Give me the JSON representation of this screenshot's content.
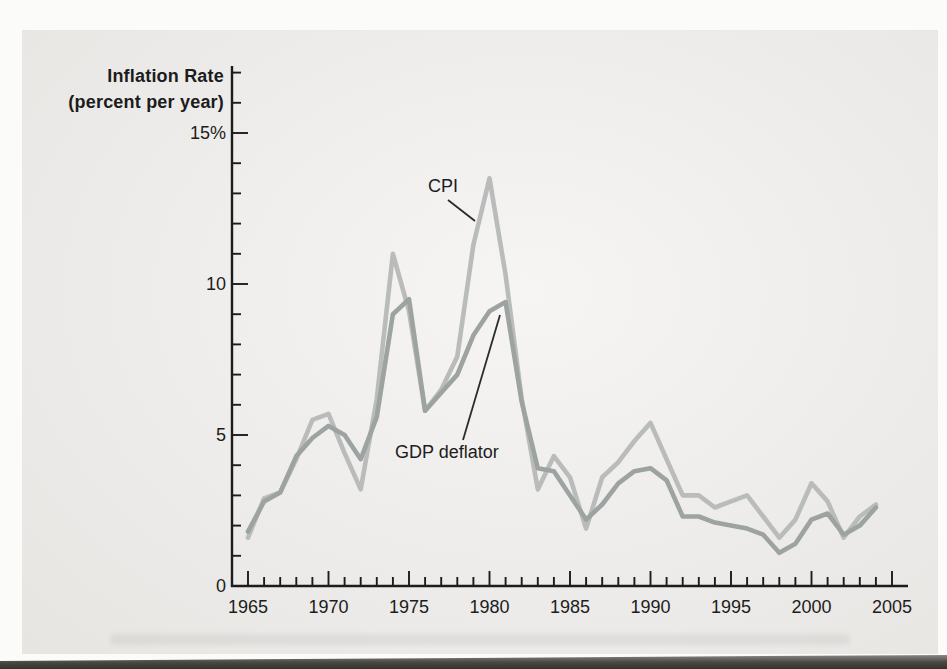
{
  "figure": {
    "panel_bg": "#edecea",
    "page_bg": "#fbfbfa",
    "axis_color": "#1c1c1c"
  },
  "chart_data": {
    "type": "line",
    "title_lines": [
      "Inflation Rate",
      "(percent per year)"
    ],
    "xlabel": "",
    "ylabel": "Inflation Rate (percent per year)",
    "xlim": [
      1965,
      2005
    ],
    "ylim": [
      0,
      17
    ],
    "grid": false,
    "legend_position": "inline-annotations",
    "x": [
      1965,
      1966,
      1967,
      1968,
      1969,
      1970,
      1971,
      1972,
      1973,
      1974,
      1975,
      1976,
      1977,
      1978,
      1979,
      1980,
      1981,
      1982,
      1983,
      1984,
      1985,
      1986,
      1987,
      1988,
      1989,
      1990,
      1991,
      1992,
      1993,
      1994,
      1995,
      1996,
      1997,
      1998,
      1999,
      2000,
      2001,
      2002,
      2003,
      2004
    ],
    "series": [
      {
        "name": "CPI",
        "color": "#b9bcba",
        "values": [
          1.6,
          2.9,
          3.1,
          4.2,
          5.5,
          5.7,
          4.4,
          3.2,
          6.2,
          11.0,
          9.1,
          5.8,
          6.5,
          7.6,
          11.3,
          13.5,
          10.3,
          6.2,
          3.2,
          4.3,
          3.6,
          1.9,
          3.6,
          4.1,
          4.8,
          5.4,
          4.2,
          3.0,
          3.0,
          2.6,
          2.8,
          3.0,
          2.3,
          1.6,
          2.2,
          3.4,
          2.8,
          1.6,
          2.3,
          2.7
        ]
      },
      {
        "name": "GDP deflator",
        "color": "#9da3a1",
        "values": [
          1.8,
          2.8,
          3.1,
          4.3,
          4.9,
          5.3,
          5.0,
          4.2,
          5.6,
          9.0,
          9.5,
          5.8,
          6.4,
          7.0,
          8.3,
          9.1,
          9.4,
          6.1,
          3.9,
          3.8,
          3.0,
          2.2,
          2.7,
          3.4,
          3.8,
          3.9,
          3.5,
          2.3,
          2.3,
          2.1,
          2.0,
          1.9,
          1.7,
          1.1,
          1.4,
          2.2,
          2.4,
          1.7,
          2.0,
          2.6
        ]
      }
    ],
    "x_axis": {
      "tick_years": [
        1965,
        1970,
        1975,
        1980,
        1985,
        1990,
        1995,
        2000,
        2005
      ],
      "tick_labels": [
        "1965",
        "1970",
        "1975",
        "1980",
        "1985",
        "1990",
        "1995",
        "2000",
        "2005"
      ],
      "minor_tick_step": 1
    },
    "y_axis": {
      "tick_values": [
        0,
        5,
        10,
        15
      ],
      "tick_labels": [
        "0",
        "5",
        "10",
        "15%"
      ],
      "minor_tick_step": 1,
      "minor_tick_max": 17
    },
    "annotations": [
      {
        "label": "CPI",
        "points_to_series": "CPI"
      },
      {
        "label": "GDP deflator",
        "points_to_series": "GDP deflator"
      }
    ]
  }
}
